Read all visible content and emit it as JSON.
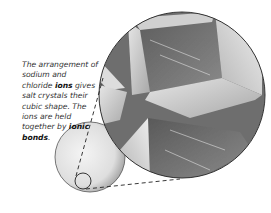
{
  "caption": {
    "part1": "The arrangement of sodium and chloride ",
    "term1": "ions",
    "part2": " gives salt crystals their cubic shape. The ions are held together by ",
    "term2": "ionic bonds",
    "part3": "."
  },
  "illustration": {
    "salt_grain": "salt-grain-sphere",
    "magnifier": "magnified-crystal-view",
    "colors": {
      "outline": "#333333",
      "crystal_dark": "#6e6e6e",
      "crystal_light": "#dcdcdc",
      "grain": "#e2e2e2"
    }
  }
}
